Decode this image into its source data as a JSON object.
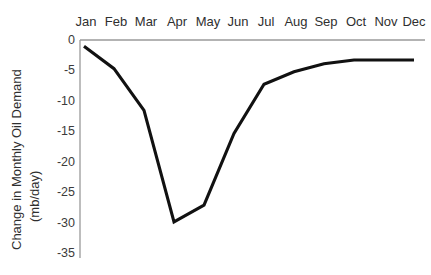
{
  "chart_data": {
    "type": "line",
    "title": "",
    "xlabel": "",
    "ylabel": "Change in Monthly Oil Demand (mb/day)",
    "ylabel_line1": "Change in Monthly Oil Demand",
    "ylabel_line2": "(mb/day)",
    "categories": [
      "Jan",
      "Feb",
      "Mar",
      "Apr",
      "May",
      "Jun",
      "Jul",
      "Aug",
      "Sep",
      "Oct",
      "Nov",
      "Dec"
    ],
    "values": [
      -1,
      -4.6,
      -11.3,
      -29.2,
      -26.5,
      -15,
      -7.1,
      -5.1,
      -3.8,
      -3.2,
      -3.2,
      -3.2
    ],
    "series": [
      {
        "name": "Change in Monthly Oil Demand",
        "values": [
          -1,
          -4.6,
          -11.3,
          -29.2,
          -26.5,
          -15,
          -7.1,
          -5.1,
          -3.8,
          -3.2,
          -3.2,
          -3.2
        ]
      }
    ],
    "ylim": [
      -35,
      0
    ],
    "yticks": [
      0,
      -5,
      -10,
      -15,
      -20,
      -25,
      -30,
      -35
    ],
    "ytick_labels": [
      "0",
      "-5",
      "-10",
      "-15",
      "-20",
      "-25",
      "-30",
      "-35"
    ],
    "grid": false,
    "legend": false,
    "legend_position": "none",
    "xaxis_position": "top",
    "line_color": "#111111",
    "axis_color": "#9a9a9a",
    "text_color": "#2f2f2f"
  }
}
